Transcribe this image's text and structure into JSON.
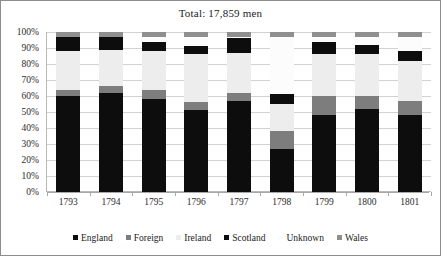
{
  "chart_data": {
    "type": "bar",
    "stacked": true,
    "stack_mode": "percent",
    "title": "Total: 17,859 men",
    "xlabel": "",
    "ylabel": "",
    "ylim": [
      0,
      100
    ],
    "ytick_labels": [
      "0%",
      "10%",
      "20%",
      "30%",
      "40%",
      "50%",
      "60%",
      "70%",
      "80%",
      "90%",
      "100%"
    ],
    "ytick_values": [
      0,
      10,
      20,
      30,
      40,
      50,
      60,
      70,
      80,
      90,
      100
    ],
    "grid": true,
    "legend_position": "bottom",
    "categories": [
      "1793",
      "1794",
      "1795",
      "1796",
      "1797",
      "1798",
      "1799",
      "1800",
      "1801"
    ],
    "series": [
      {
        "name": "England",
        "color": "#0d0d0d",
        "values": [
          60,
          62,
          58,
          51,
          57,
          27,
          48,
          52,
          48
        ]
      },
      {
        "name": "Foreign",
        "color": "#7d7d7d",
        "values": [
          4,
          4,
          6,
          5,
          5,
          11,
          12,
          8,
          9
        ]
      },
      {
        "name": "Ireland",
        "color": "#ededed",
        "values": [
          24,
          23,
          24,
          30,
          25,
          17,
          26,
          26,
          25
        ]
      },
      {
        "name": "Scotland",
        "color": "#0d0d0d",
        "values": [
          9,
          8,
          6,
          5,
          9,
          6,
          8,
          6,
          6
        ]
      },
      {
        "name": "Unknown",
        "color": "#fcfcfc",
        "values": [
          0,
          0,
          3,
          6,
          1,
          36,
          3,
          5,
          9
        ]
      },
      {
        "name": "Wales",
        "color": "#8f8f8f",
        "values": [
          3,
          3,
          3,
          3,
          3,
          3,
          3,
          3,
          3
        ]
      }
    ]
  },
  "legend": {
    "items": [
      {
        "label": "England",
        "color": "#0d0d0d"
      },
      {
        "label": "Foreign",
        "color": "#7d7d7d"
      },
      {
        "label": "Ireland",
        "color": "#ededed"
      },
      {
        "label": "Scotland",
        "color": "#0d0d0d"
      },
      {
        "label": "Unknown",
        "color": "#fcfcfc"
      },
      {
        "label": "Wales",
        "color": "#8f8f8f"
      }
    ]
  }
}
